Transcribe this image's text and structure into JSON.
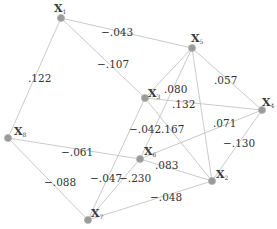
{
  "diagram": {
    "type": "weighted-graph",
    "nodes": [
      {
        "id": "X1",
        "label": "X",
        "sub": "1",
        "x": 61,
        "y": 18,
        "lx": 54,
        "ly": 12
      },
      {
        "id": "X5",
        "label": "X",
        "sub": "5",
        "x": 192,
        "y": 48,
        "lx": 191,
        "ly": 42
      },
      {
        "id": "X3",
        "label": "X",
        "sub": "3",
        "x": 145,
        "y": 98,
        "lx": 148,
        "ly": 97
      },
      {
        "id": "X4",
        "label": "X",
        "sub": "4",
        "x": 262,
        "y": 110,
        "lx": 262,
        "ly": 106
      },
      {
        "id": "X8",
        "label": "X",
        "sub": "8",
        "x": 8,
        "y": 138,
        "lx": 14,
        "ly": 135
      },
      {
        "id": "X6",
        "label": "X",
        "sub": "6",
        "x": 140,
        "y": 159,
        "lx": 144,
        "ly": 155
      },
      {
        "id": "X2",
        "label": "X",
        "sub": "2",
        "x": 212,
        "y": 181,
        "lx": 216,
        "ly": 178
      },
      {
        "id": "X7",
        "label": "X",
        "sub": "7",
        "x": 88,
        "y": 220,
        "lx": 91,
        "ly": 217
      }
    ],
    "edges": [
      {
        "from": "X1",
        "to": "X5",
        "weight": "−.043",
        "lx": 101,
        "ly": 36
      },
      {
        "from": "X1",
        "to": "X8",
        "weight": ".122",
        "lx": 28,
        "ly": 82
      },
      {
        "from": "X1",
        "to": "X3",
        "weight": "−.107",
        "lx": 97,
        "ly": 68
      },
      {
        "from": "X5",
        "to": "X3",
        "weight": ".080",
        "lx": 164,
        "ly": 93
      },
      {
        "from": "X5",
        "to": "X6",
        "weight": "−.042",
        "lx": 129,
        "ly": 133
      },
      {
        "from": "X5",
        "to": "X4",
        "weight": ".057",
        "lx": 214,
        "ly": 84
      },
      {
        "from": "X5",
        "to": "X2",
        "weight": "",
        "lx": 0,
        "ly": 0
      },
      {
        "from": "X3",
        "to": "X4",
        "weight": ".132",
        "lx": 172,
        "ly": 108
      },
      {
        "from": "X3",
        "to": "X2",
        "weight": ".167",
        "lx": 161,
        "ly": 133
      },
      {
        "from": "X3",
        "to": "X7",
        "weight": "−.047",
        "lx": 90,
        "ly": 182
      },
      {
        "from": "X8",
        "to": "X6",
        "weight": "−.061",
        "lx": 61,
        "ly": 156
      },
      {
        "from": "X8",
        "to": "X7",
        "weight": "−.088",
        "lx": 44,
        "ly": 186
      },
      {
        "from": "X6",
        "to": "X4",
        "weight": ".071",
        "lx": 213,
        "ly": 127
      },
      {
        "from": "X6",
        "to": "X2",
        "weight": ".083",
        "lx": 155,
        "ly": 169
      },
      {
        "from": "X6",
        "to": "X7",
        "weight": "−.230",
        "lx": 119,
        "ly": 182
      },
      {
        "from": "X4",
        "to": "X2",
        "weight": "−.130",
        "lx": 223,
        "ly": 147
      },
      {
        "from": "X7",
        "to": "X2",
        "weight": "−.048",
        "lx": 150,
        "ly": 201
      }
    ]
  }
}
